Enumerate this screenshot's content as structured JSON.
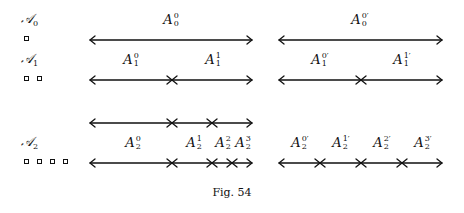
{
  "caption": "Fig. 54",
  "rows": [
    {
      "name": "A0",
      "label_base": "𝒜",
      "label_sub": "0",
      "squares": 1,
      "intervals": [
        {
          "base": "A",
          "sup": "0",
          "sub": "0"
        },
        {
          "base": "A",
          "sup": "0′",
          "sub": "0"
        }
      ]
    },
    {
      "name": "A1",
      "label_base": "𝒜",
      "label_sub": "1",
      "squares": 2,
      "intervals": [
        {
          "base": "A",
          "sup": "0",
          "sub": "1"
        },
        {
          "base": "A",
          "sup": "1",
          "sub": "1"
        },
        {
          "base": "A",
          "sup": "0′",
          "sub": "1"
        },
        {
          "base": "A",
          "sup": "1′",
          "sub": "1"
        }
      ]
    },
    {
      "name": "A2",
      "label_base": "𝒜",
      "label_sub": "2",
      "squares": 4,
      "intervals": [
        {
          "base": "A",
          "sup": "0",
          "sub": "2"
        },
        {
          "base": "A",
          "sup": "1",
          "sub": "2"
        },
        {
          "base": "A",
          "sup": "2",
          "sub": "2"
        },
        {
          "base": "A",
          "sup": "3",
          "sub": "2"
        },
        {
          "base": "A",
          "sup": "0′",
          "sub": "2"
        },
        {
          "base": "A",
          "sup": "1′",
          "sub": "2"
        },
        {
          "base": "A",
          "sup": "2′",
          "sub": "2"
        },
        {
          "base": "A",
          "sup": "3′",
          "sub": "2"
        }
      ]
    }
  ],
  "colors": {
    "ink": "#111111",
    "background": "#ffffff"
  }
}
